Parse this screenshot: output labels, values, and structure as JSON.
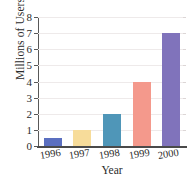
{
  "chart_data": {
    "type": "bar",
    "title": "",
    "title_note": "cropped-off at top edge, illegible",
    "categories": [
      "1996",
      "1997",
      "1998",
      "1999",
      "2000"
    ],
    "values": [
      0.5,
      1,
      2,
      4,
      7
    ],
    "xlabel": "Year",
    "ylabel": "Millions of Users",
    "ylim": [
      0,
      8
    ],
    "yticks": [
      0,
      1,
      2,
      3,
      4,
      5,
      6,
      7,
      8
    ],
    "ytick_labels": [
      "0",
      "1",
      "2",
      "3",
      "4",
      "5",
      "6",
      "7",
      "8"
    ],
    "grid": true,
    "legend": false,
    "bar_colors": [
      "#5b6fc0",
      "#f7dc9a",
      "#4f96b8",
      "#f4998c",
      "#8073bb"
    ]
  },
  "style": {
    "background": "#ffffff",
    "axis_color": "#4a4a4a",
    "grid_color": "#eeeaea",
    "text_color": "#2b2b2b"
  }
}
